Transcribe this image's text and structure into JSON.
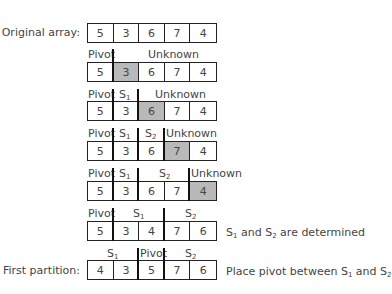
{
  "rows": [
    {
      "label": "Original array:",
      "values": [
        "5",
        "3",
        "6",
        "7",
        "4"
      ],
      "highlight": null,
      "regions": [],
      "note": ""
    },
    {
      "label": "",
      "values": [
        "5",
        "3",
        "6",
        "7",
        "4"
      ],
      "highlight": 1,
      "regions": [
        "Pivot",
        "Unknown"
      ],
      "note": ""
    },
    {
      "label": "",
      "values": [
        "5",
        "3",
        "6",
        "7",
        "4"
      ],
      "highlight": 2,
      "regions": [
        "Pivot",
        "S1",
        "Unknown"
      ],
      "note": ""
    },
    {
      "label": "",
      "values": [
        "5",
        "3",
        "6",
        "7",
        "4"
      ],
      "highlight": 3,
      "regions": [
        "Pivot",
        "S1",
        "S2",
        "Unknown"
      ],
      "note": ""
    },
    {
      "label": "",
      "values": [
        "5",
        "3",
        "6",
        "7",
        "4"
      ],
      "highlight": 4,
      "regions": [
        "Pivot",
        "S1",
        "S2",
        "Unknown"
      ],
      "note": ""
    },
    {
      "label": "",
      "values": [
        "5",
        "3",
        "4",
        "7",
        "6"
      ],
      "highlight": null,
      "regions": [
        "Pivot",
        "S1",
        "S2"
      ],
      "note": "S1 and S2 are determined"
    },
    {
      "label": "First partition:",
      "values": [
        "4",
        "3",
        "5",
        "7",
        "6"
      ],
      "highlight": null,
      "regions": [
        "S1",
        "Pivot",
        "S2"
      ],
      "note": "Place pivot between S1 and S2"
    }
  ],
  "text": {
    "pivot": "Pivot",
    "unknown": "Unknown",
    "s": "S",
    "one": "1",
    "two": "2",
    "and": " and ",
    "are_determined": " are determined",
    "place_pivot": "Place pivot between "
  },
  "colors": {
    "highlight": "#b9b9b9",
    "border": "#222222",
    "separator": "#111111"
  }
}
